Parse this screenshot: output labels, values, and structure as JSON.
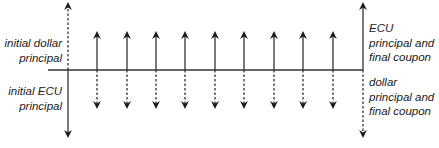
{
  "diagram": {
    "type": "cash-flow swap timeline",
    "line_color": "#333333",
    "labels": {
      "initial_dollar": [
        "initial dollar",
        "principal"
      ],
      "initial_ecu": [
        "initial ECU",
        "principal"
      ],
      "final_ecu": [
        "ECU",
        "principal and",
        "final coupon"
      ],
      "final_dollar": [
        "dollar",
        "principal and",
        "final coupon"
      ]
    },
    "arrows": {
      "initial": {
        "x": 68,
        "up": "dashed",
        "down": "solid"
      },
      "intermediate_x": [
        97,
        127,
        156,
        185,
        215,
        244,
        274,
        303,
        333
      ],
      "intermediate_up": "solid",
      "intermediate_down": "dashed",
      "final": {
        "x": 363,
        "up": "solid",
        "down": "dashed"
      }
    },
    "axis": {
      "x_start": 48,
      "x_end": 363,
      "y": 70
    }
  }
}
